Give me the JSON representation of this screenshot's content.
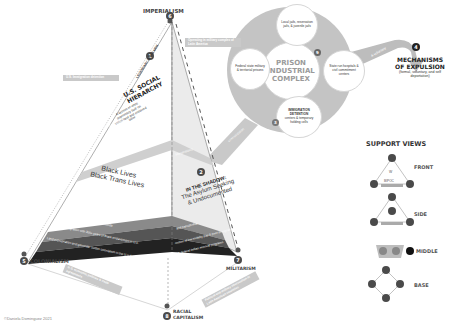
{
  "diagram": {
    "apex_label": "IMPERIALISM",
    "apex_number": "6",
    "left_corner_label": "COLONIALISM",
    "left_corner_number": "5",
    "right_corner_label": "MILITARISM",
    "right_corner_number": "7",
    "bottom_corner_label_line1": "RACIAL",
    "bottom_corner_label_line2": "CAPITALISM",
    "bottom_corner_number": "8",
    "copyright": "©Daniela Dominguez 2021"
  },
  "left_face": {
    "number": "1",
    "top_label": "LEGENDARY WHITE MEN",
    "title": "U.S. SOCIAL HIERARCHY",
    "description": "A system of white supremacy built on stolen land and enslaved labor",
    "side_note": "U.S. lifetime",
    "band_label": "Mechanisms of stratification",
    "center_line1": "Black Lives",
    "center_line2": "Black Trans Lives",
    "layers": [
      "Global imperialism, slavery, and genocide",
      "Restricted migration with 300+ years of Black enslavement in U.S.",
      "Land expropriation and genocide: Settler colonialism in the U.S.A."
    ]
  },
  "right_face": {
    "number": "2",
    "title": "IN THE SHADOW:",
    "subtitle_line1": "The Asylum Seeking",
    "subtitle_line2": "& Undocumented",
    "band_label": "Marginalized",
    "layers": [
      "and transphobia",
      "control of low mobility pay & poor immigration",
      "U.S. federal Indian removal programs"
    ]
  },
  "banners": {
    "top_right": "Operating in military complex of Latin America",
    "left_mid": "U.S. Immigration detention",
    "bottom_left": "U.S. economic policies & trade agreements",
    "bottom_right": "Political and military intervention in Latin American countries"
  },
  "prison_complex": {
    "number": "3",
    "title_line1": "PRISON",
    "title_line2": "INDUSTRIAL",
    "title_line3": "COMPLEX",
    "center_badge": "9",
    "satellites": [
      {
        "id": "top",
        "text": "Local jails, reservation jails, & juvenile jails"
      },
      {
        "id": "left",
        "text": "Federal state military & territorial prisons"
      },
      {
        "id": "right",
        "text": "State run hospitals & civil commitment centers"
      },
      {
        "id": "bottom",
        "title": "IMMIGRATION DETENTION",
        "text": "centers & temporary holding cells"
      }
    ],
    "flow_label_1": "deportation",
    "flow_label_2": "& voluntary",
    "inbound_label": "criminalization"
  },
  "expulsion": {
    "number": "4",
    "title_line1": "MECHANISMS",
    "title_line2": "OF EXPULSION",
    "subtitle": "(formal, voluntary, and self deportation)"
  },
  "support_views": {
    "title": "SUPPORT VIEWS",
    "items": [
      {
        "label": "FRONT",
        "inner_top": "W",
        "inner_bottom": "BIPOC"
      },
      {
        "label": "SIDE"
      },
      {
        "label": "MIDDLE"
      },
      {
        "label": "BASE"
      }
    ]
  },
  "colors": {
    "dark": "#2a2a2a",
    "mid": "#6e6e6e",
    "light_gray": "#c9c9c9",
    "face_right": "#ebebeb",
    "circle_bg": "#bdbdbd"
  }
}
